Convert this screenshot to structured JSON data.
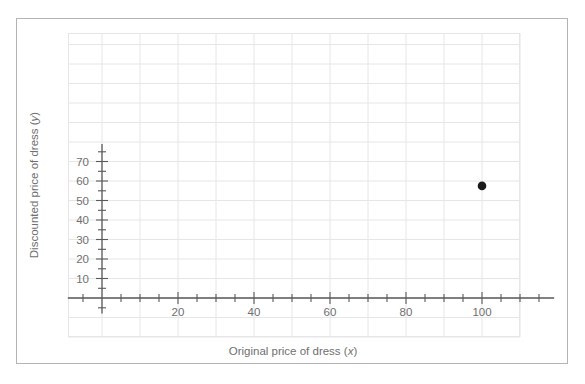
{
  "figure": {
    "background_color": "#ffffff",
    "frame_color": "#b4b4b4",
    "grid_color": "#e6e6e6",
    "axis_color": "#595959",
    "tick_label_color": "#6f6f6f",
    "point_color": "#1a1a1a"
  },
  "chart_data": {
    "type": "scatter",
    "title": "",
    "subtitle": "",
    "xlabel": "Original price of dress (x)",
    "ylabel": "Discounted price of dress (y)",
    "xlabel_plain": "Original price of dress",
    "xlabel_variable": "x",
    "ylabel_plain": "Discounted price of dress",
    "ylabel_variable": "y",
    "xlim": [
      -9,
      119
    ],
    "ylim": [
      -8,
      79
    ],
    "xticks": [
      20,
      40,
      60,
      80,
      100
    ],
    "yticks": [
      10,
      20,
      30,
      40,
      50,
      60,
      70
    ],
    "xtick_labels": [
      "20",
      "40",
      "60",
      "80",
      "100"
    ],
    "ytick_labels": [
      "10",
      "20",
      "30",
      "40",
      "50",
      "60",
      "70"
    ],
    "x_minor_tick_step": 5,
    "y_minor_tick_step": 5,
    "x_major_tick_step": 20,
    "y_major_tick_step": 10,
    "grid": true,
    "grid_step_x": 10,
    "grid_step_y": 10,
    "legend": false,
    "legend_position": "none",
    "series": [
      {
        "name": "dress",
        "marker": "circle",
        "color": "#1a1a1a",
        "points": [
          {
            "x": 100,
            "y": 57.5
          }
        ]
      }
    ],
    "annotations": []
  }
}
